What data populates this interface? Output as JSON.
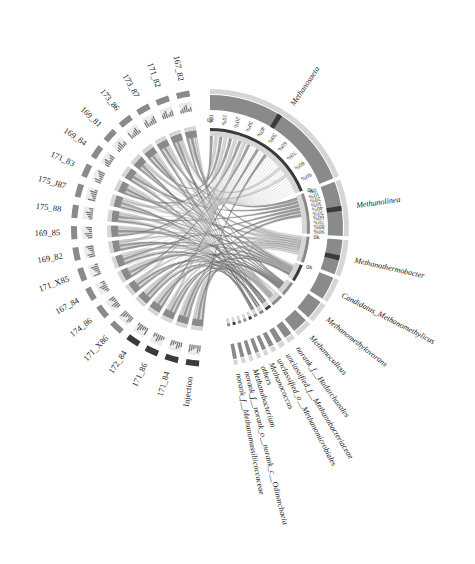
{
  "chart_data": {
    "type": "chord",
    "title": "",
    "color_mode": "grayscale",
    "center": [
      210,
      228
    ],
    "samples": [
      {
        "name": "167_82",
        "value": 5
      },
      {
        "name": "171_82",
        "value": 5
      },
      {
        "name": "173_87",
        "value": 5
      },
      {
        "name": "173_86",
        "value": 5
      },
      {
        "name": "169_81",
        "value": 5
      },
      {
        "name": "169_84",
        "value": 5
      },
      {
        "name": "171_83",
        "value": 5
      },
      {
        "name": "175_J87",
        "value": 5
      },
      {
        "name": "175_88",
        "value": 5
      },
      {
        "name": "169_85",
        "value": 5
      },
      {
        "name": "169_82",
        "value": 5
      },
      {
        "name": "171_X85",
        "value": 5
      },
      {
        "name": "167_84",
        "value": 5
      },
      {
        "name": "174_86",
        "value": 5
      },
      {
        "name": "171_X86",
        "value": 5
      },
      {
        "name": "172_84",
        "value": 5
      },
      {
        "name": "171_86",
        "value": 5
      },
      {
        "name": "171_84",
        "value": 5
      },
      {
        "name": "Injection",
        "value": 5
      }
    ],
    "genera": [
      {
        "name": "Methanosaeta",
        "value": 40
      },
      {
        "name": "Methanolinea",
        "value": 14
      },
      {
        "name": "Methanothermobacter",
        "value": 9
      },
      {
        "name": "Candidatus_Methanomethylicus",
        "value": 6
      },
      {
        "name": "Methanomethylovorans",
        "value": 5
      },
      {
        "name": "Methanoculleus",
        "value": 4
      },
      {
        "name": "norank_f__Hadarchaeales",
        "value": 2
      },
      {
        "name": "unclassified_f__Methanobacteriaceae",
        "value": 1.5
      },
      {
        "name": "unclassified_o__Methanomicrobiales",
        "value": 1.2
      },
      {
        "name": "Methanococcus",
        "value": 1
      },
      {
        "name": "others",
        "value": 1
      },
      {
        "name": "Methanobacterium",
        "value": 1
      },
      {
        "name": "norank_f__norank_o__norank_c__Odinarchaeia",
        "value": 1
      },
      {
        "name": "norank_f__Methanomassiliicoccaceae",
        "value": 1
      }
    ],
    "percent_ticks": [
      "0%",
      "10%",
      "20%",
      "30%",
      "40%",
      "50%",
      "60%",
      "70%",
      "80%",
      "90%"
    ],
    "abs_tick_label": "0k",
    "colors": {
      "background": "#ffffff",
      "ring_light": "#d6d6d6",
      "ring_mid": "#8a8a8a",
      "ring_dark": "#3a3a3a",
      "ribbon": "#7a7a7a",
      "ribbon_light": "#c8c8c8",
      "text": "#222222"
    }
  }
}
